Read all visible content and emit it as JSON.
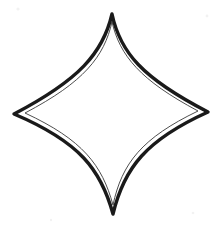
{
  "canvas": {
    "width": 224,
    "height": 229,
    "background_color": "#ffffff",
    "title": "Four-pointed star outline drawing"
  },
  "drawing": {
    "name": "four-pointed-star",
    "description": "Hand-drawn concave four-pointed star (astroid diamond) with a double outline",
    "ink_color": "#1a1a1a",
    "inner_line_color": "#3a3a3a",
    "fill_color": "#ffffff",
    "outer_stroke_width": 3.4,
    "inner_stroke_width": 0.9,
    "points": {
      "top": {
        "x": 112,
        "y": 14
      },
      "right": {
        "x": 208,
        "y": 112
      },
      "bottom": {
        "x": 113,
        "y": 214
      },
      "left": {
        "x": 14,
        "y": 114
      }
    },
    "outer_path": "M 112 14 C 120 52 142 78 208 112 C 146 140 124 168 113 214 C 101 170 80 142 14 114 C 79 80 103 53 112 14 Z",
    "inner_path": "M 112 22 C 120 56 140 80 198 111 C 142 138 122 163 113 205 C 102 165 83 140 25 113 C 84 82 104 57 112 22 Z",
    "specks": [
      {
        "cx": 18,
        "cy": 9,
        "r": 1.6
      },
      {
        "cx": 207,
        "cy": 16,
        "r": 1.4
      },
      {
        "cx": 136,
        "cy": 101,
        "r": 1.2
      },
      {
        "cx": 193,
        "cy": 213,
        "r": 1.3
      },
      {
        "cx": 51,
        "cy": 220,
        "r": 1.2
      }
    ]
  }
}
